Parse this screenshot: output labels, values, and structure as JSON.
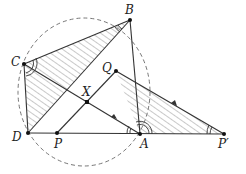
{
  "diagram": {
    "points": {
      "B": {
        "label": "B",
        "x": 130,
        "y": 20
      },
      "C": {
        "label": "C",
        "x": 24,
        "y": 64
      },
      "D": {
        "label": "D",
        "x": 28,
        "y": 133
      },
      "A": {
        "label": "A",
        "x": 140,
        "y": 134
      },
      "P": {
        "label": "P",
        "x": 57,
        "y": 133
      },
      "Pp": {
        "label": "P′",
        "x": 224,
        "y": 134
      },
      "Q": {
        "label": "Q",
        "x": 116,
        "y": 71
      },
      "X": {
        "label": "X",
        "x": 87,
        "y": 102
      }
    },
    "segments": [
      "C-B",
      "C-D",
      "D-Pp",
      "B-D",
      "B-A",
      "C-A",
      "P-Q",
      "Q-Pp"
    ],
    "hatched_triangles": [
      "C-B-D",
      "A-Q-Pp"
    ],
    "circle": {
      "style": "dashed",
      "through": [
        "B",
        "C",
        "D",
        "A"
      ]
    },
    "angle_marks": [
      "C (double)",
      "B (double)",
      "A (double, at Q-A-P′)",
      "A (double, at C-A-D)",
      "P′ (double)"
    ],
    "arrows": [
      "on C-A toward C",
      "on Q-P′ toward Q"
    ]
  }
}
